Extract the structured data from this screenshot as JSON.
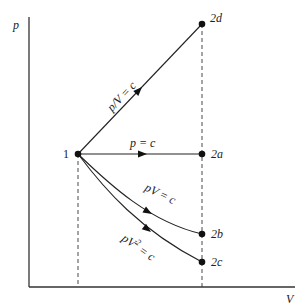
{
  "diagram": {
    "axes": {
      "y_label": "p",
      "x_label": "V"
    },
    "points": [
      {
        "id": "1",
        "label": "1"
      },
      {
        "id": "2a",
        "label": "2a"
      },
      {
        "id": "2b",
        "label": "2b"
      },
      {
        "id": "2c",
        "label": "2c"
      },
      {
        "id": "2d",
        "label": "2d"
      }
    ],
    "processes": [
      {
        "id": "1-2d",
        "equation": "p/V = c",
        "from": "1",
        "to": "2d"
      },
      {
        "id": "1-2a",
        "equation": "p = c",
        "from": "1",
        "to": "2a"
      },
      {
        "id": "1-2b",
        "equation": "pV = c",
        "from": "1",
        "to": "2b"
      },
      {
        "id": "1-2c",
        "equation_base": "pV",
        "equation_exp": "2",
        "equation_rest": " = c",
        "from": "1",
        "to": "2c"
      }
    ]
  }
}
